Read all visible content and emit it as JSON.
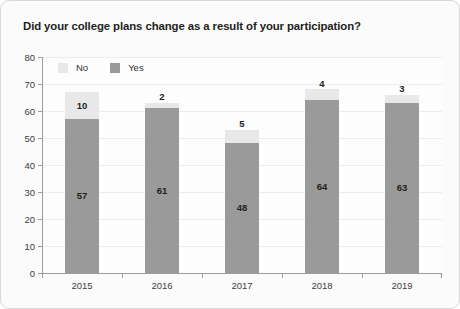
{
  "chart_data": {
    "type": "bar",
    "subtype": "stacked-column",
    "title": "Did your college plans change as a result of your participation?",
    "xlabel": "",
    "ylabel": "",
    "categories": [
      "2015",
      "2016",
      "2017",
      "2018",
      "2019"
    ],
    "series": [
      {
        "name": "Yes",
        "values": [
          57,
          61,
          48,
          64,
          63
        ],
        "color": "#9a9a9a"
      },
      {
        "name": "No",
        "values": [
          10,
          2,
          5,
          4,
          3
        ],
        "color": "#e8e8e8"
      }
    ],
    "stack_order": [
      "Yes",
      "No"
    ],
    "ylim": [
      0,
      80
    ],
    "ytick_step": 10,
    "yticks": [
      "80",
      "70",
      "60",
      "50",
      "40",
      "30",
      "20",
      "10",
      "0"
    ],
    "grid": true,
    "grid_axis": "y",
    "legend_position": "top-left-inside",
    "legend": [
      {
        "label": "No",
        "color": "#e8e8e8"
      },
      {
        "label": "Yes",
        "color": "#9a9a9a"
      }
    ],
    "data_labels": true,
    "data_label_note": "Each stacked segment is annotated with its value; small No segments show the value above the bar."
  },
  "figure": {
    "border_color": "#d8d8d8",
    "background": "#fbfbfb",
    "axis_color": "#9c9c9c",
    "gridline_color": "#ececec",
    "text_color": "#231f20"
  }
}
